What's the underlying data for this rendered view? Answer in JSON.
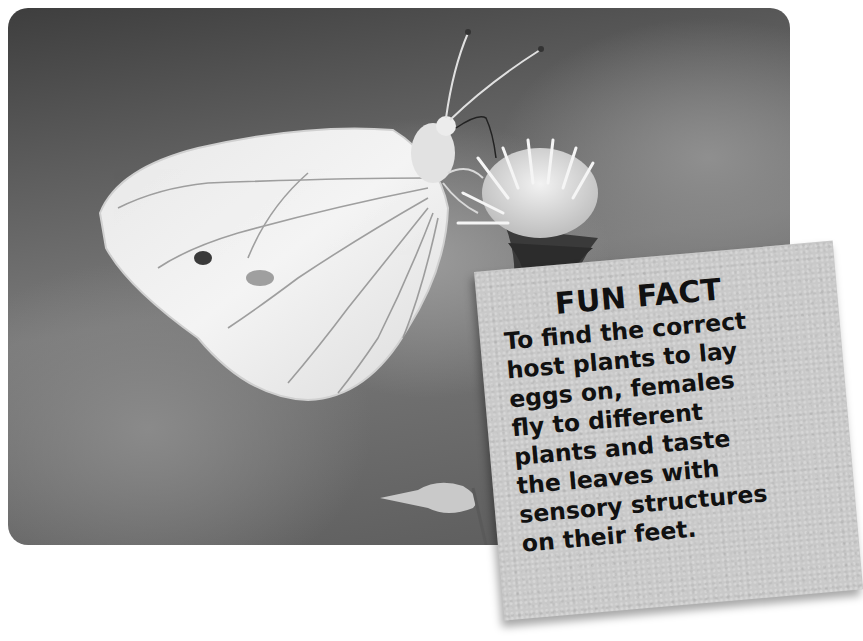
{
  "photo": {
    "subject": "white butterfly on flower",
    "style": "grayscale"
  },
  "fun_fact": {
    "title": "FUN FACT",
    "lines": [
      "To find the correct",
      "host plants to lay",
      "eggs on, females",
      "fly to different",
      "plants and taste",
      "the leaves with",
      "sensory structures",
      "on their feet."
    ],
    "text": "To find the correct host plants to lay eggs on, females fly to different plants and taste the leaves with sensory structures on their feet."
  }
}
